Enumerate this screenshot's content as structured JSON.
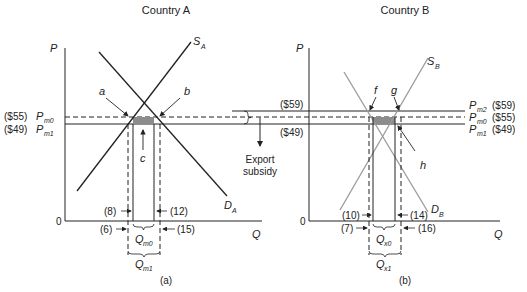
{
  "panels": [
    {
      "id": "a",
      "title": "Country A",
      "caption": "(a)",
      "y_axis_label": "P",
      "x_axis_label": "Q",
      "origin_label": "0",
      "supply_label": "S",
      "supply_sub": "A",
      "demand_label": "D",
      "demand_sub": "A",
      "prices": [
        {
          "value": "($55)",
          "symbol": "P",
          "sub": "m0",
          "style": "dashed"
        },
        {
          "value": "($49)",
          "symbol": "P",
          "sub": "m1",
          "style": "solid"
        }
      ],
      "points": {
        "a": "a",
        "b": "b",
        "c": "c"
      },
      "quantities": {
        "inner_left": "(8)",
        "inner_right": "(12)",
        "outer_left": "(6)",
        "outer_right": "(15)"
      },
      "brace_inner": {
        "symbol": "Q",
        "sub": "m0"
      },
      "brace_outer": {
        "symbol": "Q",
        "sub": "m1"
      }
    },
    {
      "id": "b",
      "title": "Country B",
      "caption": "(b)",
      "y_axis_label": "P",
      "x_axis_label": "Q",
      "origin_label": "0",
      "supply_label": "S",
      "supply_sub": "B",
      "demand_label": "D",
      "demand_sub": "B",
      "left_prices": {
        "top": "($59)",
        "bottom": "($49)"
      },
      "prices": [
        {
          "value": "($59)",
          "symbol": "P",
          "sub": "m2",
          "style": "solid"
        },
        {
          "value": "($55)",
          "symbol": "P",
          "sub": "m0",
          "style": "dashed"
        },
        {
          "value": "($49)",
          "symbol": "P",
          "sub": "m1",
          "style": "solid"
        }
      ],
      "points": {
        "f": "f",
        "g": "g",
        "h": "h"
      },
      "quantities": {
        "inner_left": "(10)",
        "inner_right": "(14)",
        "outer_left": "(7)",
        "outer_right": "(16)"
      },
      "brace_inner": {
        "symbol": "Q",
        "sub": "x0"
      },
      "brace_outer": {
        "symbol": "Q",
        "sub": "x1"
      }
    }
  ],
  "annotation": {
    "line1": "Export",
    "line2": "subsidy"
  },
  "colors": {
    "line": "#222222",
    "gray_line": "#9a9a9a",
    "shade": "#8c8c8c"
  }
}
